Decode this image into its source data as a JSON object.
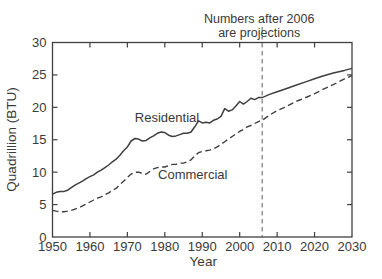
{
  "chart_data": {
    "type": "line",
    "title": "",
    "xlabel": "Year",
    "ylabel": "Quadrillion (BTU)",
    "xlim": [
      1950,
      2030
    ],
    "ylim": [
      0,
      30
    ],
    "x_ticks": [
      1950,
      1960,
      1970,
      1980,
      1990,
      2000,
      2010,
      2020,
      2030
    ],
    "y_ticks": [
      0,
      5,
      10,
      15,
      20,
      25,
      30
    ],
    "grid": false,
    "legend_position": "inline-labels",
    "annotation": {
      "lines": [
        "Numbers after 2006",
        "are projections"
      ],
      "vline_x": 2006,
      "vline_style": "dashed"
    },
    "series": [
      {
        "name": "Residential",
        "style": "solid",
        "label": {
          "text": "Residential",
          "x": 1972.0,
          "y": 17.7
        },
        "points": [
          [
            1950,
            6.6
          ],
          [
            1951,
            6.9
          ],
          [
            1952,
            7.0
          ],
          [
            1953,
            7.0
          ],
          [
            1954,
            7.2
          ],
          [
            1955,
            7.6
          ],
          [
            1956,
            8.0
          ],
          [
            1957,
            8.3
          ],
          [
            1958,
            8.6
          ],
          [
            1959,
            9.0
          ],
          [
            1960,
            9.3
          ],
          [
            1961,
            9.6
          ],
          [
            1962,
            10.0
          ],
          [
            1963,
            10.3
          ],
          [
            1964,
            10.7
          ],
          [
            1965,
            11.1
          ],
          [
            1966,
            11.6
          ],
          [
            1967,
            12.0
          ],
          [
            1968,
            12.6
          ],
          [
            1969,
            13.3
          ],
          [
            1970,
            13.9
          ],
          [
            1971,
            14.8
          ],
          [
            1972,
            15.2
          ],
          [
            1973,
            15.1
          ],
          [
            1974,
            14.8
          ],
          [
            1975,
            14.9
          ],
          [
            1976,
            15.3
          ],
          [
            1977,
            15.6
          ],
          [
            1978,
            16.0
          ],
          [
            1979,
            16.2
          ],
          [
            1980,
            16.1
          ],
          [
            1981,
            15.7
          ],
          [
            1982,
            15.5
          ],
          [
            1983,
            15.6
          ],
          [
            1984,
            15.8
          ],
          [
            1985,
            16.0
          ],
          [
            1986,
            16.0
          ],
          [
            1987,
            16.2
          ],
          [
            1988,
            17.0
          ],
          [
            1989,
            17.9
          ],
          [
            1990,
            17.6
          ],
          [
            1991,
            17.7
          ],
          [
            1992,
            17.6
          ],
          [
            1993,
            18.0
          ],
          [
            1994,
            18.2
          ],
          [
            1995,
            18.6
          ],
          [
            1996,
            19.8
          ],
          [
            1997,
            19.4
          ],
          [
            1998,
            19.6
          ],
          [
            1999,
            20.2
          ],
          [
            2000,
            20.9
          ],
          [
            2001,
            20.5
          ],
          [
            2002,
            20.9
          ],
          [
            2003,
            21.4
          ],
          [
            2004,
            21.2
          ],
          [
            2005,
            21.5
          ],
          [
            2006,
            21.5
          ],
          [
            2008,
            22.0
          ],
          [
            2010,
            22.4
          ],
          [
            2012,
            22.8
          ],
          [
            2015,
            23.4
          ],
          [
            2018,
            24.0
          ],
          [
            2020,
            24.4
          ],
          [
            2022,
            24.8
          ],
          [
            2025,
            25.3
          ],
          [
            2028,
            25.7
          ],
          [
            2030,
            26.0
          ]
        ]
      },
      {
        "name": "Commercial",
        "style": "dashed",
        "label": {
          "text": "Commercial",
          "x": 1978.2,
          "y": 8.9
        },
        "points": [
          [
            1950,
            4.1
          ],
          [
            1951,
            4.0
          ],
          [
            1952,
            3.9
          ],
          [
            1953,
            3.9
          ],
          [
            1954,
            4.0
          ],
          [
            1955,
            4.1
          ],
          [
            1956,
            4.3
          ],
          [
            1957,
            4.5
          ],
          [
            1958,
            4.8
          ],
          [
            1959,
            5.1
          ],
          [
            1960,
            5.4
          ],
          [
            1961,
            5.7
          ],
          [
            1962,
            6.0
          ],
          [
            1963,
            6.2
          ],
          [
            1964,
            6.5
          ],
          [
            1965,
            6.8
          ],
          [
            1966,
            7.2
          ],
          [
            1967,
            7.5
          ],
          [
            1968,
            8.1
          ],
          [
            1969,
            8.6
          ],
          [
            1970,
            9.2
          ],
          [
            1971,
            9.7
          ],
          [
            1972,
            10.0
          ],
          [
            1973,
            10.0
          ],
          [
            1974,
            9.8
          ],
          [
            1975,
            9.7
          ],
          [
            1976,
            10.1
          ],
          [
            1977,
            10.5
          ],
          [
            1978,
            10.7
          ],
          [
            1979,
            10.8
          ],
          [
            1980,
            10.8
          ],
          [
            1981,
            11.0
          ],
          [
            1982,
            11.2
          ],
          [
            1983,
            11.2
          ],
          [
            1984,
            11.4
          ],
          [
            1985,
            11.4
          ],
          [
            1986,
            11.6
          ],
          [
            1987,
            11.9
          ],
          [
            1988,
            12.5
          ],
          [
            1989,
            13.0
          ],
          [
            1990,
            13.2
          ],
          [
            1991,
            13.3
          ],
          [
            1992,
            13.4
          ],
          [
            1993,
            13.6
          ],
          [
            1994,
            13.9
          ],
          [
            1995,
            14.3
          ],
          [
            1996,
            14.7
          ],
          [
            1997,
            15.1
          ],
          [
            1998,
            15.5
          ],
          [
            1999,
            15.9
          ],
          [
            2000,
            16.3
          ],
          [
            2001,
            16.6
          ],
          [
            2002,
            17.0
          ],
          [
            2003,
            17.2
          ],
          [
            2004,
            17.5
          ],
          [
            2005,
            17.8
          ],
          [
            2006,
            18.0
          ],
          [
            2008,
            18.8
          ],
          [
            2010,
            19.5
          ],
          [
            2012,
            20.0
          ],
          [
            2015,
            20.9
          ],
          [
            2018,
            21.6
          ],
          [
            2020,
            22.1
          ],
          [
            2022,
            22.7
          ],
          [
            2025,
            23.5
          ],
          [
            2028,
            24.4
          ],
          [
            2030,
            24.9
          ]
        ]
      }
    ],
    "colors": {
      "line": "#3f3f3f",
      "text": "#3a3a3a",
      "vline": "#6e6e6e",
      "background": "#ffffff"
    }
  }
}
